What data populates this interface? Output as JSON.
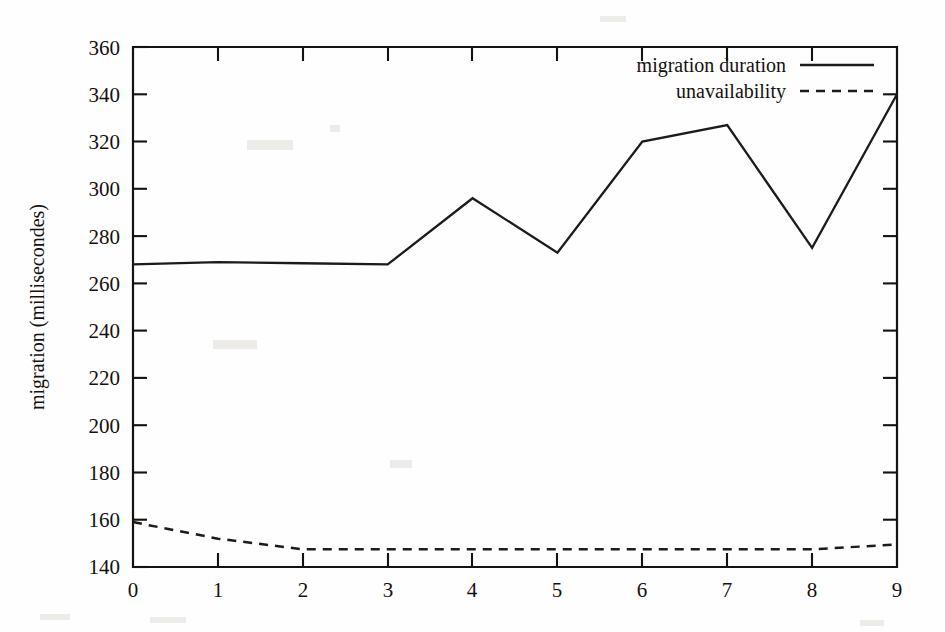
{
  "chart_data": {
    "type": "line",
    "title": "",
    "xlabel": "",
    "ylabel": "migration (millisecondes)",
    "x": [
      0,
      1,
      2,
      3,
      4,
      5,
      6,
      7,
      8,
      9
    ],
    "xlim": [
      0,
      9
    ],
    "ylim": [
      140,
      360
    ],
    "xticks": [
      "0",
      "1",
      "2",
      "3",
      "4",
      "5",
      "6",
      "7",
      "8",
      "9"
    ],
    "yticks": [
      "140",
      "160",
      "180",
      "200",
      "220",
      "240",
      "260",
      "280",
      "300",
      "320",
      "340",
      "360"
    ],
    "grid": false,
    "legend_position": "top-right",
    "series": [
      {
        "name": "migration duration",
        "style": "solid",
        "values": [
          268,
          269,
          268.5,
          268,
          296,
          273,
          320,
          327,
          275,
          340
        ]
      },
      {
        "name": "unavailability",
        "style": "dashed",
        "values": [
          159,
          152,
          147.5,
          147.5,
          147.5,
          147.5,
          147.5,
          147.5,
          147.5,
          149.5
        ]
      }
    ]
  },
  "legend": {
    "entries": [
      {
        "label": "migration duration",
        "style": "solid"
      },
      {
        "label": "unavailability",
        "style": "dashed"
      }
    ]
  },
  "axes": {
    "y_title": "migration (millisecondes)"
  }
}
